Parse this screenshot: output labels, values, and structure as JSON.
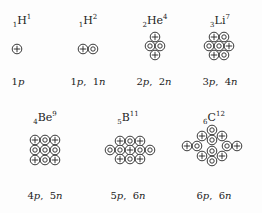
{
  "nuclei": [
    {
      "id": "h1",
      "z": "1",
      "symbol": "H",
      "a": "1",
      "caption_p": "1",
      "caption_n": "",
      "label_pos": [
        22,
        13
      ],
      "caption_pos": [
        18,
        76
      ],
      "particles": [
        {
          "t": "p",
          "x": 17,
          "y": 49
        }
      ]
    },
    {
      "id": "h2",
      "z": "1",
      "symbol": "H",
      "a": "2",
      "caption_p": "1",
      "caption_n": "1",
      "label_pos": [
        88,
        13
      ],
      "caption_pos": [
        88,
        76
      ],
      "particles": [
        {
          "t": "p",
          "x": 83,
          "y": 49
        },
        {
          "t": "n",
          "x": 93,
          "y": 49
        }
      ]
    },
    {
      "id": "he4",
      "z": "2",
      "symbol": "He",
      "a": "4",
      "caption_p": "2",
      "caption_n": "2",
      "label_pos": [
        155,
        13
      ],
      "caption_pos": [
        154,
        76
      ],
      "particles": [
        {
          "t": "p",
          "x": 155,
          "y": 37
        },
        {
          "t": "n",
          "x": 150,
          "y": 46
        },
        {
          "t": "n",
          "x": 160,
          "y": 46
        },
        {
          "t": "p",
          "x": 155,
          "y": 55
        }
      ]
    },
    {
      "id": "li7",
      "z": "3",
      "symbol": "Li",
      "a": "7",
      "caption_p": "3",
      "caption_n": "4",
      "label_pos": [
        220,
        13
      ],
      "caption_pos": [
        220,
        76
      ],
      "particles": [
        {
          "t": "p",
          "x": 214,
          "y": 37
        },
        {
          "t": "n",
          "x": 224,
          "y": 37
        },
        {
          "t": "n",
          "x": 209,
          "y": 46
        },
        {
          "t": "n",
          "x": 219,
          "y": 46
        },
        {
          "t": "p",
          "x": 229,
          "y": 46
        },
        {
          "t": "p",
          "x": 214,
          "y": 55
        },
        {
          "t": "n",
          "x": 224,
          "y": 55
        }
      ]
    },
    {
      "id": "be9",
      "z": "4",
      "symbol": "Be",
      "a": "9",
      "caption_p": "4",
      "caption_n": "5",
      "label_pos": [
        45,
        110
      ],
      "caption_pos": [
        45,
        190
      ],
      "particles": [
        {
          "t": "p",
          "x": 35,
          "y": 140
        },
        {
          "t": "n",
          "x": 45,
          "y": 140
        },
        {
          "t": "p",
          "x": 55,
          "y": 140
        },
        {
          "t": "n",
          "x": 35,
          "y": 150
        },
        {
          "t": "n",
          "x": 45,
          "y": 150
        },
        {
          "t": "n",
          "x": 55,
          "y": 150
        },
        {
          "t": "p",
          "x": 35,
          "y": 160
        },
        {
          "t": "n",
          "x": 45,
          "y": 160
        },
        {
          "t": "p",
          "x": 55,
          "y": 160
        }
      ]
    },
    {
      "id": "b11",
      "z": "5",
      "symbol": "B",
      "a": "11",
      "caption_p": "5",
      "caption_n": "6",
      "label_pos": [
        128,
        110
      ],
      "caption_pos": [
        128,
        190
      ],
      "particles": [
        {
          "t": "p",
          "x": 120,
          "y": 141
        },
        {
          "t": "n",
          "x": 130,
          "y": 141
        },
        {
          "t": "p",
          "x": 140,
          "y": 141
        },
        {
          "t": "n",
          "x": 110,
          "y": 150
        },
        {
          "t": "n",
          "x": 120,
          "y": 150
        },
        {
          "t": "p",
          "x": 130,
          "y": 150
        },
        {
          "t": "n",
          "x": 140,
          "y": 150
        },
        {
          "t": "n",
          "x": 150,
          "y": 150
        },
        {
          "t": "p",
          "x": 120,
          "y": 159
        },
        {
          "t": "n",
          "x": 130,
          "y": 159
        },
        {
          "t": "p",
          "x": 140,
          "y": 159
        }
      ]
    },
    {
      "id": "c12",
      "z": "6",
      "symbol": "C",
      "a": "12",
      "caption_p": "6",
      "caption_n": "6",
      "label_pos": [
        214,
        110
      ],
      "caption_pos": [
        214,
        190
      ],
      "particles": [
        {
          "t": "n",
          "x": 212,
          "y": 130
        },
        {
          "t": "p",
          "x": 202,
          "y": 136
        },
        {
          "t": "p",
          "x": 222,
          "y": 136
        },
        {
          "t": "n",
          "x": 212,
          "y": 140
        },
        {
          "t": "p",
          "x": 187,
          "y": 146
        },
        {
          "t": "n",
          "x": 197,
          "y": 146
        },
        {
          "t": "n",
          "x": 227,
          "y": 146
        },
        {
          "t": "p",
          "x": 237,
          "y": 146
        },
        {
          "t": "n",
          "x": 212,
          "y": 151
        },
        {
          "t": "p",
          "x": 202,
          "y": 156
        },
        {
          "t": "p",
          "x": 222,
          "y": 156
        },
        {
          "t": "n",
          "x": 212,
          "y": 161
        }
      ]
    }
  ],
  "unit_p": "p",
  "unit_n": "n",
  "colors": {
    "ink": "#222222",
    "background": "#fdfdfd"
  }
}
